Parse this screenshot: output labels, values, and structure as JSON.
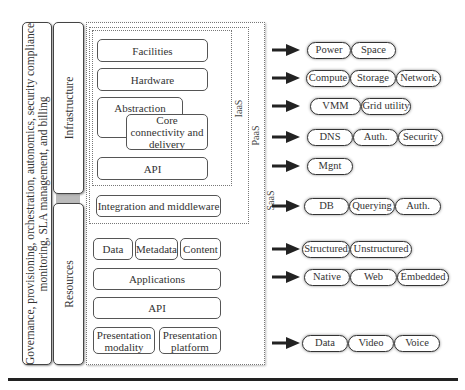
{
  "governance_bar": {
    "line1": "Governance, provisioning, orchestration, autonomics, security compliance",
    "line2": "monitoring, SLA management, and billing"
  },
  "infrastructure_bar": {
    "label": "Infrastructure"
  },
  "resources_bar": {
    "label": "Resources"
  },
  "layers": {
    "iaas": "IaaS",
    "paas": "PaaS",
    "saas": "SaaS"
  },
  "boxes": {
    "facilities": "Facilities",
    "hardware": "Hardware",
    "abstraction": "Abstraction",
    "core_connectivity": "Core connectivity and delivery",
    "api_infra": "API",
    "integration": "Integration and middleware",
    "data": "Data",
    "metadata": "Metadata",
    "content": "Content",
    "applications": "Applications",
    "api_resources": "API",
    "presentation_modality": "Presentation modality",
    "presentation_platform": "Presentation platform"
  },
  "outputs": [
    {
      "items": [
        "Power",
        "Space"
      ]
    },
    {
      "items": [
        "Compute",
        "Storage",
        "Network"
      ]
    },
    {
      "items": [
        "VMM",
        "Grid utility"
      ]
    },
    {
      "items": [
        "DNS",
        "Auth.",
        "Security"
      ]
    },
    {
      "items": [
        "Mgnt"
      ]
    },
    {
      "items": [
        "DB",
        "Querying",
        "Auth."
      ]
    },
    {
      "items": [
        "Structured",
        "Unstructured"
      ]
    },
    {
      "items": [
        "Native",
        "Web",
        "Embedded"
      ]
    },
    {
      "items": [
        "Data",
        "Video",
        "Voice"
      ]
    }
  ]
}
